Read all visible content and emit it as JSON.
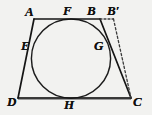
{
  "figure": {
    "kind": "geometry-diagram",
    "canvas": {
      "width": 152,
      "height": 115
    },
    "colors": {
      "background": "#f2f2f0",
      "stroke": "#1a1a1a",
      "dashed_stroke": "#3b3b3b",
      "baseline_shade": "#8f8f8f",
      "label": "#101010"
    },
    "points": [
      {
        "id": "A",
        "label": "A",
        "x": 34,
        "y": 19,
        "role": "vertex",
        "label_x": 25,
        "label_y": 5
      },
      {
        "id": "F",
        "label": "F",
        "x": 68,
        "y": 19,
        "role": "tangent-point",
        "label_x": 63,
        "label_y": 4
      },
      {
        "id": "B",
        "label": "B",
        "x": 100,
        "y": 19,
        "role": "vertex",
        "label_x": 87,
        "label_y": 4
      },
      {
        "id": "Bp",
        "label": "B′",
        "x": 113,
        "y": 19,
        "role": "auxiliary",
        "label_x": 107,
        "label_y": 4
      },
      {
        "id": "E",
        "label": "E",
        "x": 33,
        "y": 46,
        "role": "tangent-point",
        "label_x": 21,
        "label_y": 39
      },
      {
        "id": "G",
        "label": "G",
        "x": 107,
        "y": 46,
        "role": "tangent-point",
        "label_x": 94,
        "label_y": 39
      },
      {
        "id": "D",
        "label": "D",
        "x": 18,
        "y": 98,
        "role": "vertex",
        "label_x": 7,
        "label_y": 95
      },
      {
        "id": "H",
        "label": "H",
        "x": 70,
        "y": 98,
        "role": "tangent-point",
        "label_x": 64,
        "label_y": 98
      },
      {
        "id": "C",
        "label": "C",
        "x": 131,
        "y": 98,
        "role": "vertex",
        "label_x": 133,
        "label_y": 95
      }
    ],
    "circle": {
      "cx": 71,
      "cy": 58.6,
      "r": 39.6
    },
    "solid_paths": [
      {
        "name": "side-AB",
        "d": "M 34 19 L 100 19"
      },
      {
        "name": "side-BC",
        "d": "M 100 19 L 131 98"
      },
      {
        "name": "side-CD",
        "d": "M 131 98 L 18 98"
      },
      {
        "name": "side-DA",
        "d": "M 18 98 L 34 19"
      }
    ],
    "dashed_paths": [
      {
        "name": "segment-B-to-Bprime",
        "d": "M 100 19 L 113 19"
      },
      {
        "name": "segment-Bprime-to-C",
        "d": "M 113 19 L 131 98"
      }
    ],
    "baseline": {
      "name": "bottom-shade-band",
      "x1": 18,
      "x2": 131,
      "y": 98
    }
  }
}
